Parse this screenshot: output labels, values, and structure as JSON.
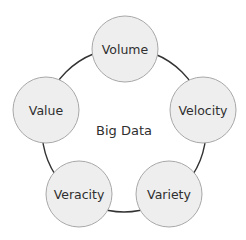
{
  "diagram": {
    "center": {
      "label": "Big Data",
      "x": 124,
      "y": 131
    },
    "ring": {
      "cx": 124,
      "cy": 130,
      "r": 82,
      "stroke": "#333333"
    },
    "node_style": {
      "r": 33,
      "fill": "#eeeeee",
      "stroke": "#a8a8a8"
    },
    "nodes": [
      {
        "label": "Volume",
        "x": 125,
        "y": 49
      },
      {
        "label": "Velocity",
        "x": 203,
        "y": 110
      },
      {
        "label": "Variety",
        "x": 169,
        "y": 194
      },
      {
        "label": "Veracity",
        "x": 79,
        "y": 194
      },
      {
        "label": "Value",
        "x": 46,
        "y": 110
      }
    ]
  }
}
